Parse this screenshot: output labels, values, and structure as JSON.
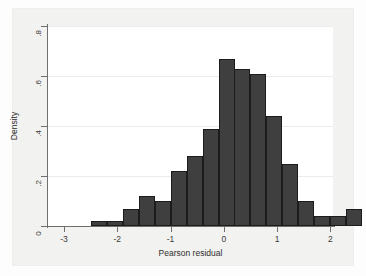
{
  "chart_data": {
    "type": "bar",
    "title": "",
    "xlabel": "Pearson residual",
    "ylabel": "Density",
    "xlim": [
      -3.3,
      2.05
    ],
    "ylim": [
      0,
      0.8
    ],
    "grid": true,
    "legend": "none",
    "bin_width": 0.3,
    "bar_color": "#3f3f3f",
    "bar_edge_color": "#1c1c1c",
    "xticks": [
      -3,
      -2,
      -1,
      0,
      1,
      2
    ],
    "xtick_labels": [
      "-3",
      "-2",
      "-1",
      "0",
      "1",
      "2"
    ],
    "yticks": [
      0,
      0.2,
      0.4,
      0.6,
      0.8
    ],
    "ytick_labels": [
      "0",
      ".2",
      ".4",
      ".6",
      ".8"
    ],
    "bins": [
      {
        "left": -2.5,
        "right": -2.2,
        "value": 0.02
      },
      {
        "left": -2.2,
        "right": -1.9,
        "value": 0.02
      },
      {
        "left": -1.9,
        "right": -1.6,
        "value": 0.07
      },
      {
        "left": -1.6,
        "right": -1.3,
        "value": 0.12
      },
      {
        "left": -1.3,
        "right": -1.0,
        "value": 0.1
      },
      {
        "left": -1.0,
        "right": -0.7,
        "value": 0.22
      },
      {
        "left": -0.7,
        "right": -0.4,
        "value": 0.28
      },
      {
        "left": -0.4,
        "right": -0.1,
        "value": 0.39
      },
      {
        "left": -0.1,
        "right": 0.2,
        "value": 0.67
      },
      {
        "left": 0.2,
        "right": 0.5,
        "value": 0.63
      },
      {
        "left": 0.5,
        "right": 0.8,
        "value": 0.61
      },
      {
        "left": 0.8,
        "right": 1.1,
        "value": 0.44
      },
      {
        "left": 1.1,
        "right": 1.4,
        "value": 0.25
      },
      {
        "left": 1.4,
        "right": 1.7,
        "value": 0.1
      },
      {
        "left": 1.7,
        "right": 2.0,
        "value": 0.04
      },
      {
        "left": 2.0,
        "right": 2.3,
        "value": 0.04
      },
      {
        "left": 2.3,
        "right": 2.6,
        "value": 0.07
      }
    ]
  }
}
